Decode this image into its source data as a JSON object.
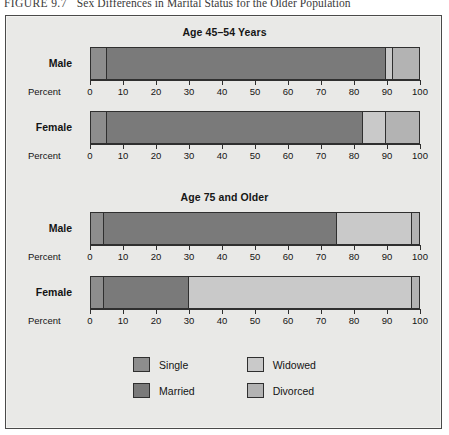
{
  "caption": {
    "figure_number": "FIGURE 9.7",
    "title": "Sex Differences in Marital Status for the Older Population"
  },
  "colors": {
    "panel_background": "#e9e9e7",
    "panel_border": "#4a4a4a",
    "single": "#8d8d8d",
    "married": "#7a7a7a",
    "widowed": "#c9c9c9",
    "divorced": "#b3b3b3",
    "segment_border": "#2f2f2f",
    "text": "#141414"
  },
  "legend": {
    "items": [
      {
        "label": "Single",
        "color_key": "single",
        "color": "#8d8d8d"
      },
      {
        "label": "Widowed",
        "color_key": "widowed",
        "color": "#c9c9c9"
      },
      {
        "label": "Married",
        "color_key": "married",
        "color": "#7a7a7a"
      },
      {
        "label": "Divorced",
        "color_key": "divorced",
        "color": "#b3b3b3"
      }
    ]
  },
  "axis": {
    "name": "Percent",
    "ticks": [
      0,
      10,
      20,
      30,
      40,
      50,
      60,
      70,
      80,
      90,
      100
    ],
    "min": 0,
    "max": 100
  },
  "chart_data": {
    "type": "bar",
    "orientation": "horizontal",
    "stacked": true,
    "title": "Sex Differences in Marital Status for the Older Population",
    "xlabel": "Percent",
    "ylabel": "",
    "xlim": [
      0,
      100
    ],
    "grid": false,
    "legend_position": "bottom",
    "series": [
      {
        "name": "Single",
        "color": "#8d8d8d"
      },
      {
        "name": "Married",
        "color": "#7a7a7a"
      },
      {
        "name": "Widowed",
        "color": "#c9c9c9"
      },
      {
        "name": "Divorced",
        "color": "#b3b3b3"
      }
    ],
    "panels": [
      {
        "title": "Age 45–54 Years",
        "categories": [
          "Male",
          "Female"
        ],
        "rows": [
          {
            "category": "Male",
            "values": {
              "Single": 5,
              "Married": 85,
              "Widowed": 2,
              "Divorced": 8
            },
            "cumulative": [
              0,
              5,
              90,
              92,
              100
            ]
          },
          {
            "category": "Female",
            "values": {
              "Single": 5,
              "Married": 78,
              "Widowed": 7,
              "Divorced": 10
            },
            "cumulative": [
              0,
              5,
              83,
              90,
              100
            ]
          }
        ]
      },
      {
        "title": "Age 75 and Older",
        "categories": [
          "Male",
          "Female"
        ],
        "rows": [
          {
            "category": "Male",
            "values": {
              "Single": 4,
              "Married": 71,
              "Widowed": 23,
              "Divorced": 2
            },
            "cumulative": [
              0,
              4,
              75,
              98,
              100
            ]
          },
          {
            "category": "Female",
            "values": {
              "Single": 4,
              "Married": 26,
              "Widowed": 68,
              "Divorced": 2
            },
            "cumulative": [
              0,
              4,
              30,
              98,
              100
            ]
          }
        ]
      }
    ]
  }
}
